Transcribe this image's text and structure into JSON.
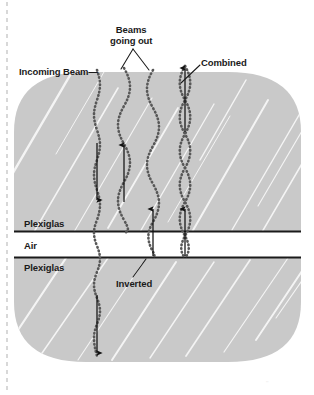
{
  "figure": {
    "background_color": "#ffffff",
    "slab_color": "#c9c9c9",
    "streak_color": "#f2f2f2",
    "line_color": "#1a1a1a",
    "wave_color": "#555555"
  },
  "labels": {
    "incoming_beam": "Incoming Beam—",
    "beams_going_out_line1": "Beams",
    "beams_going_out_line2": "going out",
    "combined": "Combined",
    "plexiglas_top": "Plexiglas",
    "air": "Air",
    "plexiglas_bottom": "Plexiglas",
    "inverted": "Inverted"
  },
  "layers": [
    {
      "name": "plexiglas-top",
      "label": "Plexiglas",
      "y_top": 72,
      "y_bottom": 231
    },
    {
      "name": "air-gap",
      "label": "Air",
      "y_top": 231,
      "y_bottom": 257
    },
    {
      "name": "plexiglas-bottom",
      "label": "Plexiglas",
      "y_top": 257,
      "y_bottom": 362
    }
  ],
  "boundaries": [
    {
      "name": "upper-interface",
      "y": 231,
      "x_start": 14,
      "x_end": 301
    },
    {
      "name": "lower-interface",
      "y": 257,
      "x_start": 14,
      "x_end": 301
    }
  ],
  "waves": [
    {
      "name": "incoming-beam-wave",
      "x": 97,
      "amplitude": 7,
      "wavelength": 38,
      "phase": 0,
      "y_start": 70,
      "y_end": 360,
      "style": "dotted"
    },
    {
      "name": "reflected-beam-wave",
      "x": 125,
      "amplitude": 10,
      "wavelength": 46,
      "phase": 0,
      "y_start": 68,
      "y_end": 232,
      "style": "dotted"
    },
    {
      "name": "second-out-beam-wave",
      "x": 153,
      "amplitude": 10,
      "wavelength": 46,
      "phase": 3.14,
      "y_start": 70,
      "y_end": 258,
      "style": "dotted"
    },
    {
      "name": "combined-beam-wave-a",
      "x": 185,
      "amplitude": 9,
      "wavelength": 40,
      "phase": 0,
      "y_start": 66,
      "y_end": 258,
      "style": "dotted"
    },
    {
      "name": "combined-beam-wave-b",
      "x": 185,
      "amplitude": 9,
      "wavelength": 40,
      "phase": 3.14,
      "y_start": 66,
      "y_end": 258,
      "style": "dotted"
    }
  ],
  "arrows": [
    {
      "name": "incoming-arrow-down-top",
      "x": 97,
      "y_start": 143,
      "y_end": 202,
      "direction": "down"
    },
    {
      "name": "out-arrow-up-left",
      "x": 124,
      "y_start": 202,
      "y_end": 143,
      "direction": "up"
    },
    {
      "name": "out-arrow-up-middle",
      "x": 153,
      "y_start": 258,
      "y_end": 207,
      "direction": "up"
    },
    {
      "name": "out-arrow-up-combined",
      "x": 185,
      "y_start": 258,
      "y_end": 207,
      "direction": "up"
    },
    {
      "name": "combined-arrow-up-top",
      "x": 185,
      "y_start": 132,
      "y_end": 66,
      "direction": "up"
    },
    {
      "name": "transmitted-arrow-down",
      "x": 97,
      "y_start": 295,
      "y_end": 355,
      "direction": "down"
    }
  ],
  "leaders": [
    {
      "name": "incoming-beam-leader",
      "from": [
        88,
        71
      ],
      "to": [
        95,
        71
      ]
    },
    {
      "name": "beams-going-out-leader-left",
      "from": [
        133,
        48
      ],
      "to": [
        120,
        68
      ]
    },
    {
      "name": "beams-going-out-leader-right",
      "from": [
        133,
        48
      ],
      "to": [
        150,
        70
      ]
    },
    {
      "name": "combined-leader",
      "from": [
        200,
        64
      ],
      "to": [
        182,
        82
      ]
    },
    {
      "name": "inverted-leader",
      "from": [
        134,
        276
      ],
      "to": [
        145,
        258
      ]
    }
  ],
  "decorations": {
    "dashed_guide_x": 7,
    "dashed_guide_top": 0,
    "dashed_guide_bottom": 395,
    "corner_mark": "''"
  }
}
